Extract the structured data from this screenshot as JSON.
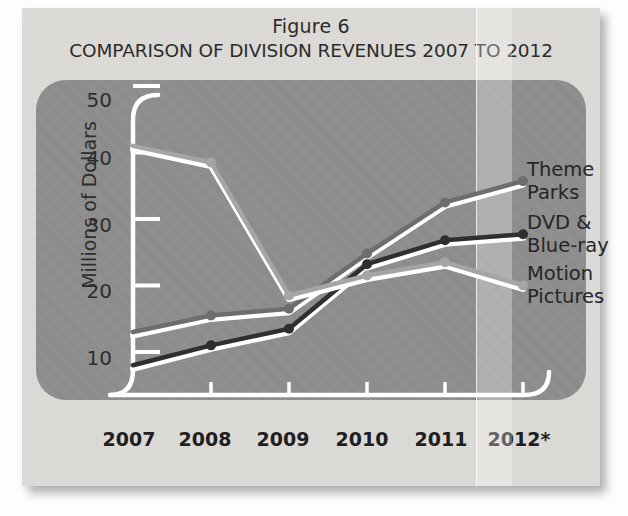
{
  "figure": {
    "label": "Figure 6",
    "title": "COMPARISON OF DIVISION REVENUES 2007 TO 2012"
  },
  "colors": {
    "panel_background": "#8e8e8e",
    "page_background": "#dedcd8",
    "axis": "#ffffff",
    "theme_parks": "#6d6d6d",
    "dvd_blue_ray": "#2f2f2f",
    "motion_pictures": "#a5a5a5",
    "label_text": "#262626"
  },
  "axes": {
    "y_title": "Millions of Dollars",
    "y_ticks": [
      "50",
      "40",
      "30",
      "20",
      "10"
    ],
    "x_ticks": [
      "2007",
      "2008",
      "2009",
      "2010",
      "2011",
      "2012*"
    ]
  },
  "series_labels": {
    "theme_parks_line1": "Theme",
    "theme_parks_line2": "Parks",
    "dvd_line1": "DVD &",
    "dvd_line2": "Blue-ray",
    "motion_line1": "Motion",
    "motion_line2": "Pictures"
  },
  "chart_data": {
    "type": "line",
    "title": "COMPARISON OF DIVISION REVENUES 2007 TO 2012",
    "subtitle": "Figure 6",
    "xlabel": "",
    "ylabel": "Millions of Dollars",
    "categories": [
      "2007",
      "2008",
      "2009",
      "2010",
      "2011",
      "2012*"
    ],
    "ylim": [
      0,
      50
    ],
    "yticks": [
      10,
      20,
      30,
      40,
      50
    ],
    "grid": false,
    "legend": "series labels at right end of each line",
    "series": [
      {
        "name": "Theme Parks",
        "color": "#6d6d6d",
        "values": [
          13,
          15.5,
          16.5,
          24.8,
          32.5,
          35.7
        ]
      },
      {
        "name": "DVD & Blue-ray",
        "color": "#2f2f2f",
        "values": [
          8,
          11,
          13.5,
          23.2,
          26.8,
          27.7
        ]
      },
      {
        "name": "Motion Pictures",
        "color": "#a5a5a5",
        "values": [
          41,
          38.5,
          18.5,
          21.5,
          23.5,
          20
        ]
      }
    ]
  }
}
